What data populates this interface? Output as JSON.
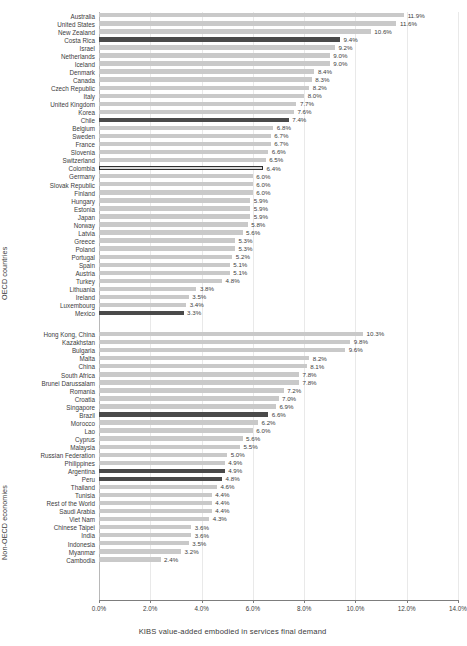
{
  "chart_data": {
    "type": "bar",
    "orientation": "horizontal",
    "title": "",
    "xlabel": "KIBS value-added embodied in services final demand",
    "ylabel": "",
    "xlim": [
      0,
      14
    ],
    "xtick_labels": [
      "0.0%",
      "2.0%",
      "4.0%",
      "6.0%",
      "8.0%",
      "10.0%",
      "12.0%",
      "14.0%"
    ],
    "xticks": [
      0,
      2,
      4,
      6,
      8,
      10,
      12,
      14
    ],
    "grid": true,
    "legend": "none",
    "value_format": "percent_1dp",
    "colors": {
      "bar_default": "#c9c9c9",
      "bar_highlight": "#4a4a4a",
      "bar_outlined_fill": "#d8d8d8",
      "bar_outlined_border": "#2e2e2e",
      "gridline": "#e9e9e9",
      "axis": "#7d7d7d",
      "text": "#3c3c3c"
    },
    "groups": [
      {
        "name": "oecd",
        "axis_title": "OECD countries",
        "categories": [
          "Australia",
          "United States",
          "New Zealand",
          "Costa Rica",
          "Israel",
          "Netherlands",
          "Iceland",
          "Denmark",
          "Canada",
          "Czech Republic",
          "Italy",
          "United Kingdom",
          "Korea",
          "Chile",
          "Belgium",
          "Sweden",
          "France",
          "Slovenia",
          "Switzerland",
          "Colombia",
          "Germany",
          "Slovak Republic",
          "Finland",
          "Hungary",
          "Estonia",
          "Japan",
          "Norway",
          "Latvia",
          "Greece",
          "Poland",
          "Portugal",
          "Spain",
          "Austria",
          "Turkey",
          "Lithuania",
          "Ireland",
          "Luxembourg",
          "Mexico"
        ],
        "values": [
          11.9,
          11.6,
          10.6,
          9.4,
          9.2,
          9.0,
          9.0,
          8.4,
          8.3,
          8.2,
          8.0,
          7.7,
          7.6,
          7.4,
          6.8,
          6.7,
          6.7,
          6.6,
          6.5,
          6.4,
          6.0,
          6.0,
          6.0,
          5.9,
          5.9,
          5.9,
          5.8,
          5.6,
          5.3,
          5.3,
          5.2,
          5.1,
          5.1,
          4.8,
          3.8,
          3.5,
          3.4,
          3.3
        ],
        "labels": [
          "11.9%",
          "11.6%",
          "10.6%",
          "9.4%",
          "9.2%",
          "9.0%",
          "9.0%",
          "8.4%",
          "8.3%",
          "8.2%",
          "8.0%",
          "7.7%",
          "7.6%",
          "7.4%",
          "6.8%",
          "6.7%",
          "6.7%",
          "6.6%",
          "6.5%",
          "6.4%",
          "6.0%",
          "6.0%",
          "6.0%",
          "5.9%",
          "5.9%",
          "5.9%",
          "5.8%",
          "5.6%",
          "5.3%",
          "5.3%",
          "5.2%",
          "5.1%",
          "5.1%",
          "4.8%",
          "3.8%",
          "3.5%",
          "3.4%",
          "3.3%"
        ],
        "styles": [
          "default",
          "default",
          "default",
          "highlight",
          "default",
          "default",
          "default",
          "default",
          "default",
          "default",
          "default",
          "default",
          "default",
          "highlight",
          "default",
          "default",
          "default",
          "default",
          "default",
          "outlined",
          "default",
          "default",
          "default",
          "default",
          "default",
          "default",
          "default",
          "default",
          "default",
          "default",
          "default",
          "default",
          "default",
          "default",
          "default",
          "default",
          "default",
          "highlight"
        ]
      },
      {
        "name": "non_oecd",
        "axis_title": "Non-OECD economies",
        "categories": [
          "Hong Kong, China",
          "Kazakhstan",
          "Bulgaria",
          "Malta",
          "China",
          "South Africa",
          "Brunei Darussalam",
          "Romania",
          "Croatia",
          "Singapore",
          "Brazil",
          "Morocco",
          "Lao",
          "Cyprus",
          "Malaysia",
          "Russian Federation",
          "Philippines",
          "Argentina",
          "Peru",
          "Thailand",
          "Tunisia",
          "Rest of the World",
          "Saudi Arabia",
          "Viet Nam",
          "Chinese Taipei",
          "India",
          "Indonesia",
          "Myanmar",
          "Cambodia"
        ],
        "values": [
          10.3,
          9.8,
          9.6,
          8.2,
          8.1,
          7.8,
          7.8,
          7.2,
          7.0,
          6.9,
          6.6,
          6.2,
          6.0,
          5.6,
          5.5,
          5.0,
          4.9,
          4.9,
          4.8,
          4.6,
          4.4,
          4.4,
          4.4,
          4.3,
          3.6,
          3.6,
          3.5,
          3.2,
          2.4
        ],
        "labels": [
          "10.3%",
          "9.8%",
          "9.6%",
          "8.2%",
          "8.1%",
          "7.8%",
          "7.8%",
          "7.2%",
          "7.0%",
          "6.9%",
          "6.6%",
          "6.2%",
          "6.0%",
          "5.6%",
          "5.5%",
          "5.0%",
          "4.9%",
          "4.9%",
          "4.8%",
          "4.6%",
          "4.4%",
          "4.4%",
          "4.4%",
          "4.3%",
          "3.6%",
          "3.6%",
          "3.5%",
          "3.2%",
          "2.4%"
        ],
        "styles": [
          "default",
          "default",
          "default",
          "default",
          "default",
          "default",
          "default",
          "default",
          "default",
          "default",
          "highlight",
          "default",
          "default",
          "default",
          "default",
          "default",
          "default",
          "highlight",
          "highlight",
          "default",
          "default",
          "default",
          "default",
          "default",
          "default",
          "default",
          "default",
          "default",
          "default"
        ]
      }
    ]
  }
}
